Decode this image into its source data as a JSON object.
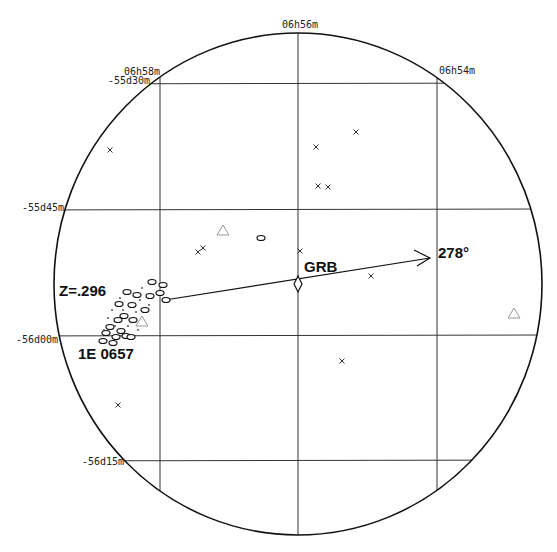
{
  "chart_data": {
    "type": "scatter",
    "title": "",
    "projection": "circular sky field (RA/Dec)",
    "circle": {
      "cx": 298,
      "cy": 284,
      "rx": 244,
      "ry": 251
    },
    "grid": {
      "ra_lines": [
        {
          "label": "06h58m",
          "x": 160
        },
        {
          "label": "06h56m",
          "x": 298
        },
        {
          "label": "06h54m",
          "x": 437
        }
      ],
      "dec_lines": [
        {
          "label": "-55d30m",
          "y": 84
        },
        {
          "label": "-55d45m",
          "y": 209
        },
        {
          "label": "-56d00m",
          "y": 335
        },
        {
          "label": "-56d15m",
          "y": 461
        }
      ]
    },
    "annotations": {
      "grb": {
        "label": "GRB",
        "x": 298,
        "y": 284
      },
      "angle": {
        "label": "278°"
      },
      "redshift": {
        "label": "Z=.296"
      },
      "cluster": {
        "label": "1E 0657"
      }
    },
    "arrow": {
      "x1": 165,
      "y1": 300,
      "x2": 430,
      "y2": 258
    },
    "series": [
      {
        "name": "x-marks",
        "marker": "x",
        "points": [
          [
            110,
            150
          ],
          [
            316,
            147
          ],
          [
            356,
            132
          ],
          [
            318,
            186
          ],
          [
            328,
            187
          ],
          [
            198,
            252
          ],
          [
            203,
            248
          ],
          [
            300,
            251
          ],
          [
            371,
            276
          ],
          [
            342,
            361
          ],
          [
            118,
            405
          ]
        ]
      },
      {
        "name": "triangles",
        "marker": "triangle",
        "points": [
          [
            223,
            231
          ],
          [
            142,
            322
          ],
          [
            514,
            314
          ]
        ]
      },
      {
        "name": "galaxies",
        "marker": "ellipse",
        "points": [
          [
            261,
            238
          ],
          [
            166,
            300
          ],
          [
            152,
            282
          ],
          [
            163,
            285
          ],
          [
            150,
            296
          ],
          [
            160,
            293
          ],
          [
            127,
            292
          ],
          [
            137,
            295
          ],
          [
            119,
            304
          ],
          [
            132,
            305
          ],
          [
            145,
            310
          ],
          [
            124,
            316
          ],
          [
            118,
            320
          ],
          [
            133,
            320
          ],
          [
            110,
            327
          ],
          [
            121,
            331
          ],
          [
            106,
            333
          ],
          [
            116,
            337
          ],
          [
            103,
            341
          ],
          [
            113,
            343
          ],
          [
            126,
            336
          ],
          [
            131,
            337
          ]
        ]
      }
    ]
  }
}
